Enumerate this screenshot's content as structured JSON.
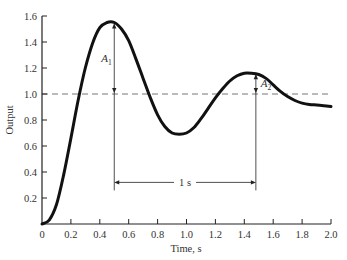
{
  "chart_data": {
    "type": "line",
    "title": "",
    "xlabel": "Time, s",
    "ylabel": "Output",
    "xlim": [
      0,
      2.0
    ],
    "ylim": [
      0,
      1.6
    ],
    "grid": false,
    "legend": null,
    "x_ticks": [
      "0",
      "0.2",
      "0.4",
      "0.6",
      "0.8",
      "1.0",
      "1.2",
      "1.4",
      "1.6",
      "1.8",
      "2.0"
    ],
    "y_ticks": [
      "0.2",
      "0.4",
      "0.6",
      "0.8",
      "1.0",
      "1.2",
      "1.4",
      "1.6"
    ],
    "series": [
      {
        "name": "Output",
        "x": [
          0,
          0.05,
          0.1,
          0.15,
          0.2,
          0.25,
          0.3,
          0.35,
          0.4,
          0.45,
          0.5,
          0.55,
          0.6,
          0.65,
          0.7,
          0.75,
          0.8,
          0.85,
          0.9,
          0.95,
          1.0,
          1.05,
          1.1,
          1.15,
          1.2,
          1.25,
          1.3,
          1.35,
          1.4,
          1.45,
          1.5,
          1.55,
          1.6,
          1.65,
          1.7,
          1.75,
          1.8,
          1.85,
          1.9,
          1.95,
          2.0
        ],
        "values": [
          0,
          0.03,
          0.15,
          0.38,
          0.66,
          0.95,
          1.2,
          1.39,
          1.51,
          1.55,
          1.55,
          1.5,
          1.41,
          1.27,
          1.12,
          0.97,
          0.84,
          0.75,
          0.7,
          0.69,
          0.7,
          0.74,
          0.81,
          0.89,
          0.97,
          1.04,
          1.1,
          1.14,
          1.16,
          1.16,
          1.15,
          1.12,
          1.07,
          1.02,
          0.98,
          0.95,
          0.93,
          0.92,
          0.915,
          0.91,
          0.905
        ]
      },
      {
        "name": "Final value (dashed)",
        "x": [
          0,
          2.0
        ],
        "values": [
          1.0,
          1.0
        ]
      }
    ],
    "annotations": [
      {
        "label": "A",
        "subscript": "1",
        "description": "First overshoot amplitude",
        "x": 0.5,
        "from": 1.0,
        "to": 1.55
      },
      {
        "label": "A",
        "subscript": "2",
        "description": "Second overshoot amplitude",
        "x": 1.48,
        "from": 1.0,
        "to": 1.16
      },
      {
        "label": "1 s",
        "description": "Period between peaks",
        "x_from": 0.5,
        "x_to": 1.48,
        "y": 0.32
      }
    ]
  }
}
